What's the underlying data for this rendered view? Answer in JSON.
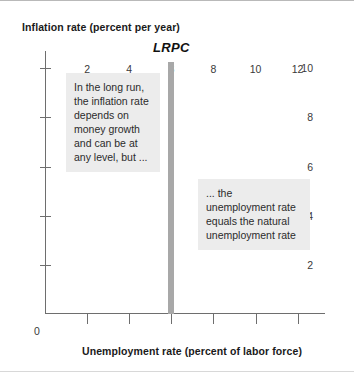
{
  "chart_data": {
    "type": "line",
    "title": "",
    "xlabel": "Unemployment rate (percent of labor force)",
    "ylabel": "Inflation rate (percent per year)",
    "xlim": [
      0,
      13.3
    ],
    "ylim": [
      0,
      10.7
    ],
    "xticks": [
      0,
      2,
      4,
      6,
      8,
      10,
      12
    ],
    "xtick_labels": [
      "0",
      "2",
      "4",
      "6",
      "8",
      "10",
      "12"
    ],
    "yticks": [
      2,
      4,
      6,
      8,
      10
    ],
    "ytick_labels": [
      "2",
      "4",
      "6",
      "8",
      "10"
    ],
    "grid": false,
    "legend": "none",
    "series": [
      {
        "name": "LRPC",
        "label": "LRPC",
        "description": "Vertical long-run Phillips curve at the natural unemployment rate",
        "orientation": "vertical",
        "x": [
          6,
          6
        ],
        "y": [
          0,
          10.25
        ],
        "color": "#a8a8a8",
        "line_width_px": 6
      }
    ],
    "annotations": [
      {
        "name": "left-note",
        "text": "In the long run, the inflation rate depends on money growth and can be at any level, but ...",
        "background": "#ececec"
      },
      {
        "name": "right-note",
        "text": "... the unemployment rate equals the natural unemployment rate",
        "background": "#ececec"
      }
    ]
  },
  "axis": {
    "y_title": "Inflation rate (percent per year)",
    "x_title": "Unemployment rate (percent of labor force)",
    "origin_label": "0"
  },
  "curve": {
    "label": "LRPC"
  },
  "notes": {
    "left": "In the long run, the inflation rate depends on money growth and can be at any level, but ...",
    "right": "... the unemployment rate equals the natural unemployment rate"
  },
  "colors": {
    "curve": "#a8a8a8",
    "axis": "#6e6e6e",
    "note_background": "#ececec",
    "text": "#1a1a1a"
  }
}
